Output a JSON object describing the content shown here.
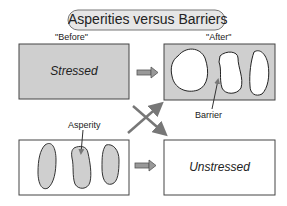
{
  "title": "Asperities versus Barriers",
  "columns": {
    "before": "\"Before\"",
    "after": "\"After\""
  },
  "panels": {
    "top_left": {
      "label": "Stressed",
      "fill": "#cfcfcf"
    },
    "top_right": {
      "callout": "Barrier",
      "fill": "#cfcfcf",
      "patch_fill": "#ffffff"
    },
    "bottom_left": {
      "callout": "Asperity",
      "fill": "#ffffff",
      "patch_fill": "#cfcfcf"
    },
    "bottom_right": {
      "label": "Unstressed",
      "fill": "#ffffff"
    }
  },
  "colors": {
    "stroke": "#333333",
    "arrow": "#7a7a7a",
    "pill": "#e6e6e6"
  }
}
